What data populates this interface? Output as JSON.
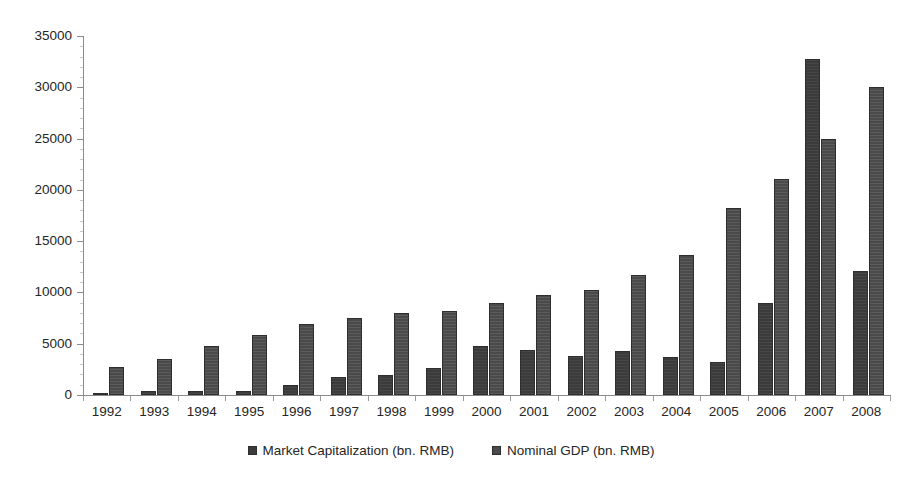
{
  "chart_data": {
    "type": "bar",
    "title": "",
    "subtitle": "",
    "xlabel": "",
    "ylabel": "",
    "ylim": [
      0,
      35000
    ],
    "ytick_step": 5000,
    "yticks": [
      "35000",
      "30000",
      "25000",
      "20000",
      "15000",
      "10000",
      "5000",
      "0"
    ],
    "grid": false,
    "legend_position": "bottom-center",
    "categories": [
      "1992",
      "1993",
      "1994",
      "1995",
      "1996",
      "1997",
      "1998",
      "1999",
      "2000",
      "2001",
      "2002",
      "2003",
      "2004",
      "2005",
      "2006",
      "2007",
      "2008"
    ],
    "series": [
      {
        "name": "Market Capitalization (bn. RMB)",
        "color": "#3b3b3b",
        "values": [
          105,
          353,
          369,
          348,
          984,
          1753,
          1951,
          2647,
          4809,
          4352,
          3832,
          4246,
          3706,
          3243,
          8940,
          32714,
          12137
        ]
      },
      {
        "name": "Nominal GDP (bn. RMB)",
        "color": "#4a4a4a",
        "values": [
          2692,
          3533,
          4820,
          5894,
          6879,
          7477,
          7955,
          8207,
          8947,
          9731,
          10239,
          11669,
          13688,
          18232,
          21087,
          24953,
          30067
        ]
      }
    ]
  },
  "axis": {
    "y_tick_labels": [
      "35000",
      "30000",
      "25000",
      "20000",
      "15000",
      "10000",
      "5000",
      "0"
    ],
    "x_tick_labels": [
      "1992",
      "1993",
      "1994",
      "1995",
      "1996",
      "1997",
      "1998",
      "1999",
      "2000",
      "2001",
      "2002",
      "2003",
      "2004",
      "2005",
      "2006",
      "2007",
      "2008"
    ]
  },
  "legend": {
    "items": [
      {
        "label": "Market Capitalization (bn. RMB)",
        "swatch": "market"
      },
      {
        "label": "Nominal GDP (bn. RMB)",
        "swatch": "gdp"
      }
    ]
  }
}
